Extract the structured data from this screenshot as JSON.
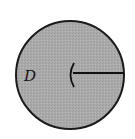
{
  "diagram": {
    "type": "disk-with-radius",
    "region_label": "D",
    "fill_color": "#a9a9a9",
    "stroke_color": "#1a1a1a",
    "circle": {
      "cx": 70,
      "cy": 75,
      "r": 55
    },
    "radius_line": {
      "x1": 73,
      "y1": 73,
      "x2": 125,
      "y2": 73
    },
    "center_arc": "left-opening arc at center"
  }
}
